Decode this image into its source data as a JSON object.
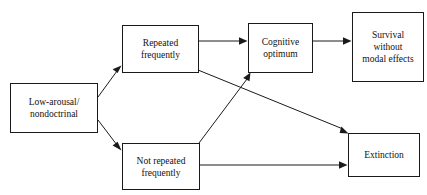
{
  "diagram": {
    "title": "",
    "type": "flowchart",
    "background_color": "#ffffff",
    "line_color": "#1a1a1a",
    "nodes": [
      {
        "id": "low_arousal",
        "label": "Low-arousal/\nnondoctrinal"
      },
      {
        "id": "repeated",
        "label": "Repeated\nfrequently"
      },
      {
        "id": "not_repeated",
        "label": "Not repeated\nfrequently"
      },
      {
        "id": "cognitive",
        "label": "Cognitive\noptimum"
      },
      {
        "id": "survival",
        "label": "Survival\nwithout\nmodal effects"
      },
      {
        "id": "extinction",
        "label": "Extinction"
      }
    ],
    "edges": [
      {
        "id": "e1",
        "from": "low_arousal",
        "to": "repeated",
        "label": "",
        "style": "diagonal-up"
      },
      {
        "id": "e2",
        "from": "low_arousal",
        "to": "not_repeated",
        "label": "",
        "style": "diagonal-down"
      },
      {
        "id": "e3",
        "from": "repeated",
        "to": "cognitive",
        "label": "",
        "style": "horizontal"
      },
      {
        "id": "e4",
        "from": "cognitive",
        "to": "survival",
        "label": "",
        "style": "horizontal"
      },
      {
        "id": "e5",
        "from": "repeated",
        "to": "extinction",
        "label": "",
        "style": "diagonal-down"
      },
      {
        "id": "e6",
        "from": "not_repeated",
        "to": "cognitive",
        "label": "",
        "style": "diagonal-up"
      },
      {
        "id": "e7",
        "from": "not_repeated",
        "to": "extinction",
        "label": "",
        "style": "horizontal"
      }
    ]
  }
}
